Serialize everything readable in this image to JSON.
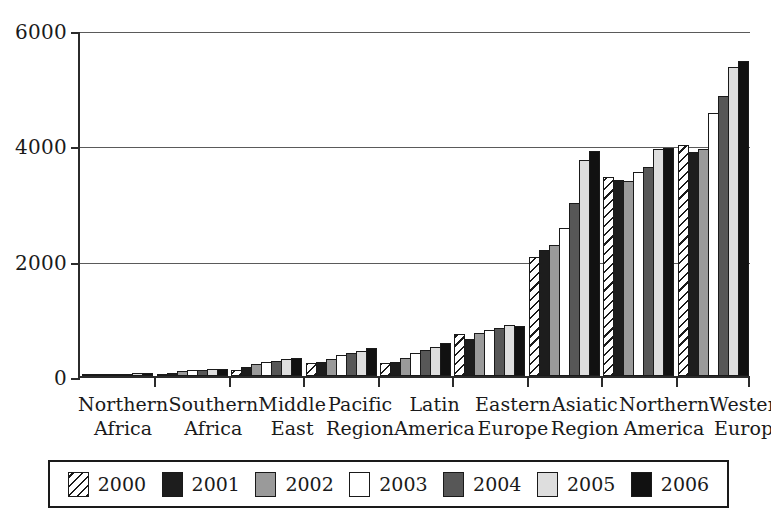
{
  "chart_data": {
    "type": "bar",
    "title": "",
    "xlabel": "",
    "ylabel": "",
    "ylim": [
      0,
      6000
    ],
    "yticks": [
      0,
      2000,
      4000,
      6000
    ],
    "grid": true,
    "legend_position": "bottom",
    "categories": [
      "Northern Africa",
      "Southern Africa",
      "Middle East",
      "Pacific Region",
      "Latin America",
      "Eastern Europe",
      "Asiatic Region",
      "Northern America",
      "Western Europe"
    ],
    "category_lines": [
      [
        "Northern",
        "Africa"
      ],
      [
        "Southern",
        "Africa"
      ],
      [
        "Middle",
        "East"
      ],
      [
        "Pacific",
        "Region"
      ],
      [
        "Latin",
        "America"
      ],
      [
        "Eastern",
        "Europe"
      ],
      [
        "Asiatic",
        "Region"
      ],
      [
        "Northern",
        "America"
      ],
      [
        "Western",
        "Europe"
      ]
    ],
    "series": [
      {
        "name": "2000",
        "fill": "hatch-diagonal",
        "color": "#ffffff",
        "values": [
          20,
          30,
          110,
          230,
          220,
          720,
          2060,
          3450,
          4000
        ]
      },
      {
        "name": "2001",
        "fill": "solid",
        "color": "#1d1d1d",
        "values": [
          25,
          55,
          150,
          250,
          250,
          650,
          2180,
          3400,
          3880
        ]
      },
      {
        "name": "2002",
        "fill": "solid",
        "color": "#9a9a9a",
        "values": [
          30,
          80,
          200,
          300,
          320,
          750,
          2280,
          3380,
          3940
        ]
      },
      {
        "name": "2003",
        "fill": "solid",
        "color": "#ffffff",
        "values": [
          35,
          100,
          240,
          360,
          400,
          800,
          2560,
          3530,
          4560
        ]
      },
      {
        "name": "2004",
        "fill": "solid",
        "color": "#575757",
        "values": [
          40,
          110,
          260,
          400,
          450,
          840,
          3000,
          3620,
          4850
        ]
      },
      {
        "name": "2005",
        "fill": "solid",
        "color": "#dedede",
        "values": [
          45,
          120,
          290,
          440,
          500,
          880,
          3740,
          3930,
          5360
        ]
      },
      {
        "name": "2006",
        "fill": "solid",
        "color": "#111111",
        "values": [
          50,
          130,
          320,
          480,
          580,
          870,
          3900,
          3960,
          5470
        ]
      }
    ]
  },
  "legend": {
    "items": [
      {
        "label": "2000",
        "swatch": "hatch-swatch-2000"
      },
      {
        "label": "2001",
        "swatch": "solid-swatch-2001"
      },
      {
        "label": "2002",
        "swatch": "solid-swatch-2002"
      },
      {
        "label": "2003",
        "swatch": "solid-swatch-2003"
      },
      {
        "label": "2004",
        "swatch": "solid-swatch-2004"
      },
      {
        "label": "2005",
        "swatch": "solid-swatch-2005"
      },
      {
        "label": "2006",
        "swatch": "solid-swatch-2006"
      }
    ]
  },
  "axis": {
    "y_tick_labels": [
      "6000",
      "4000",
      "2000",
      "0"
    ]
  }
}
